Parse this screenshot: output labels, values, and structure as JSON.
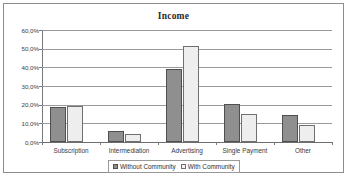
{
  "chart_data": {
    "type": "bar",
    "title": "Income",
    "xlabel": "",
    "ylabel": "",
    "categories": [
      "Subscription",
      "Intermediation",
      "Advertising",
      "Single Payment",
      "Other"
    ],
    "series": [
      {
        "name": "Without Community",
        "color": "#8f8f8f",
        "values": [
          18.8,
          6.0,
          39.2,
          20.6,
          14.6
        ]
      },
      {
        "name": "With Community",
        "color": "#eeeeee",
        "values": [
          19.4,
          4.2,
          51.5,
          15.0,
          9.3
        ]
      }
    ],
    "ylim": [
      0,
      60
    ],
    "yticks": [
      0,
      10,
      20,
      30,
      40,
      50,
      60
    ],
    "ytick_labels": [
      "0,0%",
      "10,0%",
      "20,0%",
      "30,0%",
      "40,0%",
      "50,0%",
      "60,0%"
    ],
    "grid": true,
    "legend_position": "bottom"
  }
}
